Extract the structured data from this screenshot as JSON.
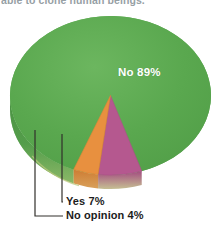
{
  "caption": {
    "text": "able to clone human beings.”"
  },
  "chart_data": {
    "type": "pie",
    "title": "",
    "subtitle": "",
    "xlabel": "",
    "ylabel": "",
    "grid": false,
    "legend_position": "none",
    "three_d": true,
    "categories": [
      "No",
      "Yes",
      "No opinion"
    ],
    "values": [
      89,
      7,
      4
    ],
    "units": "percent",
    "labels": [
      {
        "name": "No",
        "value": 89,
        "display": "No 89%",
        "color": "#5aa84f",
        "side_color": "#4a8f41",
        "label_placement": "inside",
        "label_color": "#ffffff"
      },
      {
        "name": "Yes",
        "value": 7,
        "display": "Yes 7%",
        "color": "#b5588f",
        "side_color": "#9b4a79",
        "label_placement": "callout",
        "label_color": "#1c1c1c"
      },
      {
        "name": "No opinion",
        "value": 4,
        "display": "No opinion 4%",
        "color": "#e8903f",
        "side_color": "#c77732",
        "label_placement": "callout",
        "label_color": "#1c1c1c"
      }
    ],
    "colors": {
      "no": "#5aa84f",
      "yes": "#b5588f",
      "no_opinion": "#e8903f",
      "rim_light": "#c3cf7f",
      "background": "#ffffff",
      "callout_line": "#33302c",
      "caption_text": "#6f7b82"
    }
  }
}
